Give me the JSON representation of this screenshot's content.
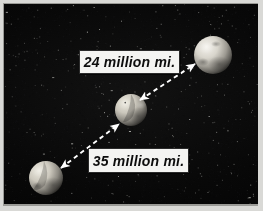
{
  "figure": {
    "name": "planet-distance-diagram",
    "border_color": "#d9d9d6",
    "space_color": "#050505"
  },
  "labels": {
    "upper": {
      "text": "24 million mi.",
      "value": 24,
      "unit": "million mi.",
      "box_color": "#f4f4f2",
      "text_color": "#0d0d0d"
    },
    "lower": {
      "text": "35 million mi.",
      "value": 35,
      "unit": "million mi.",
      "box_color": "#f4f4f2",
      "text_color": "#0d0d0d"
    }
  },
  "bodies": [
    {
      "name": "upper-right-planet",
      "cx": 209,
      "cy": 51,
      "r": 19,
      "lit_color": "#e6e4dd",
      "shadow_color": "#4a4845"
    },
    {
      "name": "middle-planet",
      "cx": 127,
      "cy": 106,
      "r": 16,
      "lit_color": "#ddd9cf",
      "shadow_color": "#3e3c38"
    },
    {
      "name": "lower-left-planet",
      "cx": 42,
      "cy": 174,
      "r": 17,
      "lit_color": "#ddd9d0",
      "shadow_color": "#403e3a"
    }
  ],
  "arrows": [
    {
      "name": "upper-distance-arrow",
      "from_x": 136,
      "from_y": 96,
      "to_x": 191,
      "to_y": 60,
      "color": "#ffffff",
      "style": "dashed-double-headed"
    },
    {
      "name": "lower-distance-arrow",
      "from_x": 57,
      "from_y": 164,
      "to_x": 115,
      "to_y": 120,
      "color": "#ffffff",
      "style": "dashed-double-headed"
    }
  ]
}
